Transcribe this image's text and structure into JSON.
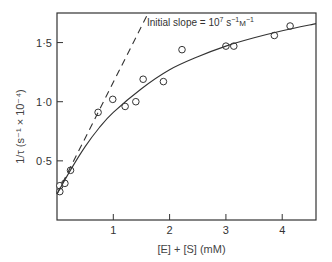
{
  "chart_data": {
    "type": "scatter",
    "title": "",
    "annotation": "Initial slope = 10^7 s^-1 M^-1",
    "annotation_parts": {
      "prefix": "Initial slope = 10",
      "exp": "7",
      "unit1": " s",
      "unit1exp": "−1",
      "unit2": "M",
      "unit2exp": "−1"
    },
    "xlabel": "[E] + [S] (mM)",
    "ylabel": "1/τ  (s⁻¹ × 10⁻⁴)",
    "xlim": [
      0,
      4.6
    ],
    "ylim": [
      0,
      1.75
    ],
    "x_ticks": [
      1,
      2,
      3,
      4
    ],
    "x_tick_labels": [
      "1",
      "2",
      "3",
      "4"
    ],
    "y_ticks": [
      0.5,
      1.0,
      1.5
    ],
    "y_tick_labels": [
      "0·5",
      "1·0",
      "1·5"
    ],
    "grid": false,
    "series": [
      {
        "name": "observed",
        "marker": "open-circle",
        "x": [
          0.05,
          0.05,
          0.14,
          0.24,
          0.73,
          0.99,
          1.21,
          1.4,
          1.53,
          1.89,
          2.22,
          3.0,
          3.14,
          3.86,
          4.14
        ],
        "y": [
          0.24,
          0.29,
          0.31,
          0.42,
          0.91,
          1.02,
          0.96,
          1.0,
          1.19,
          1.17,
          1.44,
          1.47,
          1.47,
          1.56,
          1.64
        ]
      },
      {
        "name": "fitted curve",
        "style": "solid",
        "x": [
          0.0,
          0.25,
          0.5,
          0.75,
          1.0,
          1.5,
          2.0,
          2.5,
          3.0,
          3.5,
          4.0,
          4.6
        ],
        "y": [
          0.22,
          0.43,
          0.62,
          0.78,
          0.91,
          1.11,
          1.27,
          1.38,
          1.47,
          1.54,
          1.6,
          1.66
        ]
      },
      {
        "name": "initial slope",
        "style": "dashed",
        "x": [
          0.0,
          1.62
        ],
        "y": [
          0.22,
          1.75
        ]
      }
    ]
  }
}
